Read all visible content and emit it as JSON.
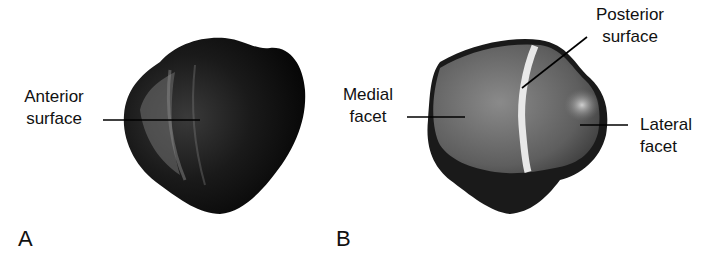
{
  "figure": {
    "panels": [
      {
        "id": "A",
        "label": "A",
        "view": "anterior",
        "annotations": [
          {
            "line1": "Anterior",
            "line2": "surface"
          }
        ]
      },
      {
        "id": "B",
        "label": "B",
        "view": "posterior",
        "annotations": [
          {
            "line1": "Medial",
            "line2": "facet"
          },
          {
            "line1": "Posterior",
            "line2": "surface"
          },
          {
            "line1": "Lateral",
            "line2": "facet"
          }
        ]
      }
    ]
  }
}
